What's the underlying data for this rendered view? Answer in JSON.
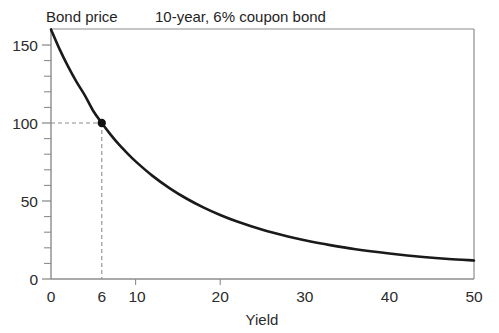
{
  "chart_data": {
    "type": "line",
    "title": "Bond price",
    "subtitle": "10-year, 6% coupon bond",
    "xlabel": "Yield",
    "ylabel": "Bond price",
    "xlim": [
      0,
      50
    ],
    "ylim": [
      0,
      163
    ],
    "grid": false,
    "legend": null,
    "x_ticks_major": [
      "0",
      "6",
      "10",
      "20",
      "30",
      "40",
      "50"
    ],
    "x_tick_values": [
      0,
      6,
      10,
      20,
      30,
      40,
      50
    ],
    "y_ticks_major": [
      "0",
      "50",
      "100",
      "150"
    ],
    "y_tick_values": [
      0,
      50,
      100,
      150
    ],
    "y_minor_step": 10,
    "series": [
      {
        "name": "Bond price vs yield",
        "x": [
          0,
          1,
          2,
          3,
          4,
          5,
          6,
          7,
          8,
          9,
          10,
          12,
          14,
          16,
          18,
          20,
          22,
          25,
          28,
          30,
          33,
          36,
          40,
          44,
          47,
          50
        ],
        "values": [
          160.0,
          147.5,
          136.4,
          126.5,
          117.7,
          107.7,
          100.0,
          92.9,
          86.4,
          80.7,
          75.4,
          66.1,
          58.3,
          51.6,
          45.9,
          41.0,
          36.8,
          31.5,
          27.2,
          24.8,
          21.7,
          19.1,
          16.4,
          14.1,
          12.8,
          11.9
        ]
      }
    ],
    "annotations": [
      {
        "name": "par-point",
        "x": 6,
        "y": 100,
        "marker": "filled-circle",
        "guides": [
          "horizontal-dashed-to-y-axis",
          "vertical-dashed-to-x-axis"
        ]
      }
    ],
    "colors": {
      "curve": "#1a1a1a",
      "axis": "#8c8c8c",
      "tick_label": "#2b2b2b",
      "guide_dash": "#8c8c8c",
      "marker": "#111111",
      "background": "#ffffff"
    }
  }
}
